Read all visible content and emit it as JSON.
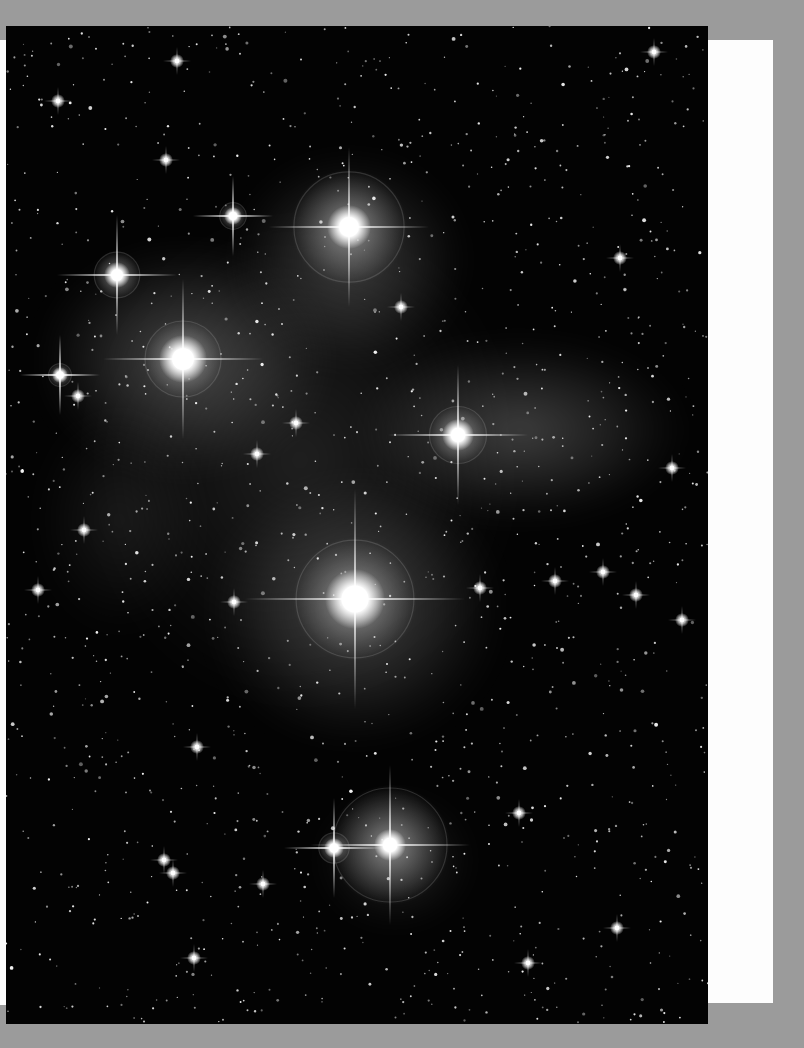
{
  "scene": {
    "width": 804,
    "height": 1048,
    "background_color": "#9b9b9b"
  },
  "paper": {
    "color": "#fdfdfd",
    "left_strip": {
      "x": 0,
      "y": 40,
      "w": 9,
      "h": 965
    },
    "right_panel": {
      "x": 706,
      "y": 40,
      "w": 67,
      "h": 963
    }
  },
  "photo": {
    "subject": "Pleiades star cluster (M45) with reflection nebula",
    "x": 6,
    "y": 26,
    "w": 702,
    "h": 998,
    "sky_color": "#030303",
    "nebula_color": "#c8c8c8",
    "nebulae": [
      {
        "cx": 185,
        "cy": 360,
        "rx": 150,
        "ry": 120,
        "opacity": 0.32
      },
      {
        "cx": 350,
        "cy": 260,
        "rx": 120,
        "ry": 110,
        "opacity": 0.28
      },
      {
        "cx": 520,
        "cy": 430,
        "rx": 170,
        "ry": 95,
        "opacity": 0.3
      },
      {
        "cx": 355,
        "cy": 610,
        "rx": 150,
        "ry": 140,
        "opacity": 0.3
      },
      {
        "cx": 300,
        "cy": 460,
        "rx": 230,
        "ry": 260,
        "opacity": 0.14
      },
      {
        "cx": 395,
        "cy": 860,
        "rx": 80,
        "ry": 70,
        "opacity": 0.18
      },
      {
        "cx": 120,
        "cy": 520,
        "rx": 90,
        "ry": 120,
        "opacity": 0.1
      }
    ],
    "bright_stars": [
      {
        "name": "Alcyone",
        "x": 355,
        "y": 599,
        "r": 30,
        "halo": 62,
        "spike": 110
      },
      {
        "name": "Merope",
        "x": 349,
        "y": 227,
        "r": 22,
        "halo": 58,
        "spike": 80
      },
      {
        "name": "Electra",
        "x": 183,
        "y": 359,
        "r": 24,
        "halo": 40,
        "spike": 80
      },
      {
        "name": "Maia",
        "x": 458,
        "y": 435,
        "r": 16,
        "halo": 30,
        "spike": 70
      },
      {
        "name": "Taygeta",
        "x": 117,
        "y": 275,
        "r": 13,
        "halo": 24,
        "spike": 60
      },
      {
        "name": "Atlas",
        "x": 390,
        "y": 845,
        "r": 16,
        "halo": 60,
        "spike": 80
      },
      {
        "name": "Pleione",
        "x": 334,
        "y": 848,
        "r": 10,
        "halo": 16,
        "spike": 50
      },
      {
        "name": "Celaeno",
        "x": 233,
        "y": 216,
        "r": 9,
        "halo": 14,
        "spike": 40
      },
      {
        "name": "Asterope",
        "x": 60,
        "y": 375,
        "r": 8,
        "halo": 12,
        "spike": 40
      }
    ],
    "medium_stars": [
      {
        "x": 78,
        "y": 396
      },
      {
        "x": 84,
        "y": 530
      },
      {
        "x": 38,
        "y": 590
      },
      {
        "x": 234,
        "y": 602
      },
      {
        "x": 296,
        "y": 423
      },
      {
        "x": 257,
        "y": 454
      },
      {
        "x": 480,
        "y": 588
      },
      {
        "x": 555,
        "y": 581
      },
      {
        "x": 603,
        "y": 572
      },
      {
        "x": 636,
        "y": 595
      },
      {
        "x": 682,
        "y": 620
      },
      {
        "x": 672,
        "y": 468
      },
      {
        "x": 197,
        "y": 747
      },
      {
        "x": 519,
        "y": 813
      },
      {
        "x": 617,
        "y": 928
      },
      {
        "x": 164,
        "y": 860
      },
      {
        "x": 173,
        "y": 873
      },
      {
        "x": 528,
        "y": 963
      },
      {
        "x": 194,
        "y": 958
      },
      {
        "x": 177,
        "y": 61
      },
      {
        "x": 58,
        "y": 101
      },
      {
        "x": 654,
        "y": 52
      },
      {
        "x": 401,
        "y": 307
      },
      {
        "x": 166,
        "y": 160
      },
      {
        "x": 620,
        "y": 258
      },
      {
        "x": 263,
        "y": 884
      }
    ],
    "star_color": "#ffffff"
  }
}
